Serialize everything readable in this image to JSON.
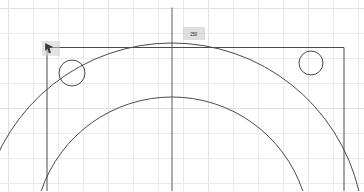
{
  "canvas": {
    "width": 364,
    "height": 191,
    "background_color": "#ffffff",
    "name": "sketch-canvas"
  },
  "grid": {
    "visible": true,
    "spacing_px": 25,
    "origin_x": 8,
    "origin_y": 8,
    "line_color": "#e8eaec",
    "major_line_color": "#dfe3e6",
    "major_every": 4
  },
  "geometry": {
    "stroke_color": "#4a4a4a",
    "stroke_width": 1,
    "rectangle": {
      "label": "boundary-rectangle",
      "x": 47,
      "y": 47.5,
      "width": 297,
      "height": 143.5,
      "open_bottom": true
    },
    "center_line": {
      "label": "center-axis",
      "x": 172,
      "y_start": 8,
      "y_end": 191,
      "color": "#5a5a5a"
    },
    "outer_arc": {
      "label": "outer-arc",
      "center_x": 172,
      "center_y": 235,
      "radius": 192,
      "apex_x": 172,
      "apex_y": 43
    },
    "inner_arc": {
      "label": "inner-arc",
      "center_x": 172,
      "center_y": 235,
      "radius": 138,
      "apex_x": 172,
      "apex_y": 97
    },
    "circles": [
      {
        "label": "left-hole",
        "cx": 72,
        "cy": 73,
        "r": 13
      },
      {
        "label": "right-hole",
        "cx": 311,
        "cy": 63,
        "r": 12
      }
    ]
  },
  "cursor": {
    "name": "arrow-cursor",
    "x": 42,
    "y": 41,
    "highlight_color": "#cdcdcd"
  },
  "dimension_label": {
    "text": "250",
    "x": 183,
    "y": 27,
    "background_color": "#cbcbcb"
  }
}
